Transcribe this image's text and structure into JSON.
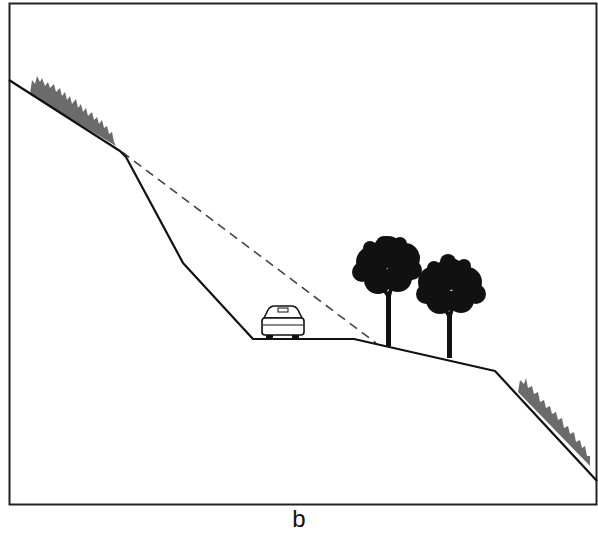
{
  "figure": {
    "caption": "b",
    "colors": {
      "line": "#111111",
      "dashed": "#444444",
      "vegetation": "#6b6b6b",
      "tree": "#111111",
      "background": "#ffffff"
    },
    "elements": [
      {
        "name": "upper-slope-vegetation",
        "type": "grass"
      },
      {
        "name": "cut-slope",
        "type": "line"
      },
      {
        "name": "original-ground-line",
        "type": "dashed-line"
      },
      {
        "name": "road-bench",
        "type": "line"
      },
      {
        "name": "car",
        "type": "vehicle"
      },
      {
        "name": "tree-1",
        "type": "tree"
      },
      {
        "name": "tree-2",
        "type": "tree"
      },
      {
        "name": "fill-slope",
        "type": "line"
      },
      {
        "name": "lower-slope-vegetation",
        "type": "grass"
      }
    ]
  }
}
